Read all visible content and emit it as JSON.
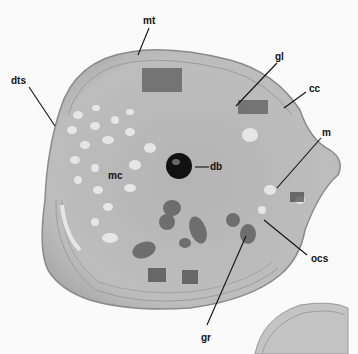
{
  "figure": {
    "type": "transmission electron micrograph",
    "background_color": "#fafafa",
    "cell_fill": "#b8b8b8",
    "labels": [
      {
        "id": "mt",
        "text": "mt",
        "x": 143,
        "y": 16
      },
      {
        "id": "gl",
        "text": "gl",
        "x": 275,
        "y": 52
      },
      {
        "id": "cc",
        "text": "cc",
        "x": 309,
        "y": 84
      },
      {
        "id": "dts",
        "text": "dts",
        "x": 11,
        "y": 77
      },
      {
        "id": "m",
        "text": "m",
        "x": 325,
        "y": 130
      },
      {
        "id": "mc",
        "text": "mc",
        "x": 108,
        "y": 174
      },
      {
        "id": "db",
        "text": "db",
        "x": 209,
        "y": 162
      },
      {
        "id": "ocs",
        "text": "ocs",
        "x": 311,
        "y": 254
      },
      {
        "id": "gr",
        "text": "gr",
        "x": 202,
        "y": 334
      }
    ]
  }
}
